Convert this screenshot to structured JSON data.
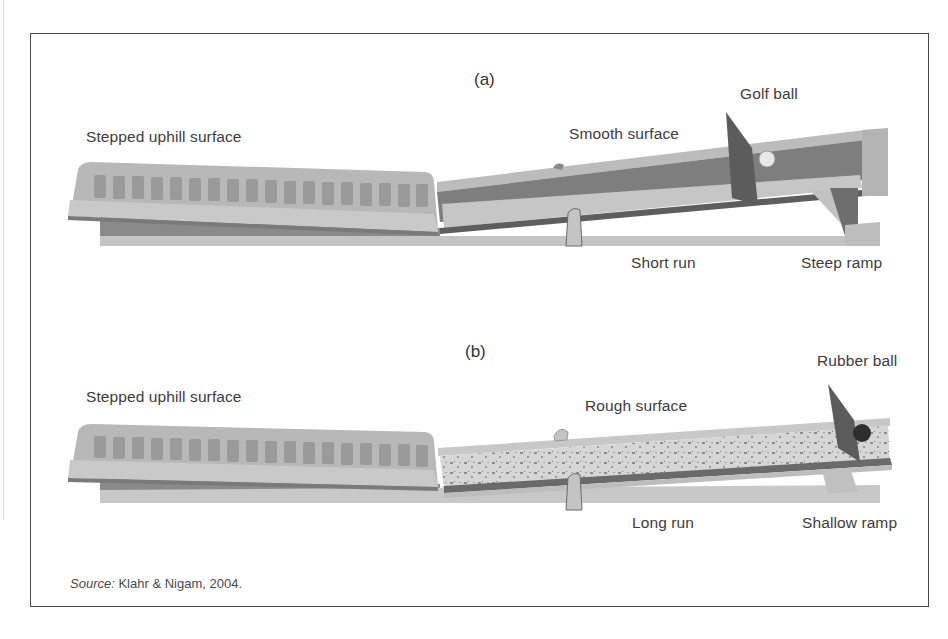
{
  "figure": {
    "panels": [
      {
        "id": "a",
        "label": "(a)",
        "labels": {
          "uphill": "Stepped uphill surface",
          "surface": "Smooth surface",
          "ball": "Golf ball",
          "run": "Short run",
          "ramp": "Steep ramp"
        }
      },
      {
        "id": "b",
        "label": "(b)",
        "labels": {
          "uphill": "Stepped uphill surface",
          "surface": "Rough surface",
          "ball": "Rubber ball",
          "run": "Long run",
          "ramp": "Shallow ramp"
        }
      }
    ],
    "source_prefix": "Source:",
    "source_text": " Klahr & Nigam, 2004.",
    "colors": {
      "frame": "#4a4a4a",
      "ramp_light": "#c9c9c9",
      "ramp_mid": "#a8a8a8",
      "ramp_dark": "#6e6e6e",
      "gate": "#5a5a5a"
    }
  }
}
